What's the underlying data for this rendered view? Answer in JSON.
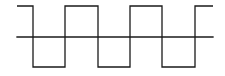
{
  "diagram": {
    "type": "square-wave",
    "colors": {
      "background": "#ffffff",
      "stroke": "#1a1a1a"
    },
    "stroke_width": 1.3,
    "axis": {
      "x1": 17,
      "x2": 213,
      "y": 37
    },
    "levels": {
      "high": 6,
      "low": 67
    },
    "start_x": 17,
    "end_x": 213,
    "start_level": "high",
    "transitions_x": [
      33,
      65,
      98,
      130,
      162,
      195
    ]
  }
}
